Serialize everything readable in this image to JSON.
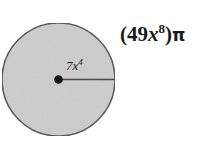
{
  "problem": {
    "number_fragment": "11."
  },
  "figure": {
    "shape": "circle",
    "fill_color": "#cfcfcf",
    "stroke_color": "#5a5a5a",
    "center_dot_color": "#141414",
    "radius_line_color": "#4a4a4a",
    "center": {
      "x": 58,
      "y": 79
    },
    "radius_px": 57,
    "radius_label": {
      "coefficient": "7",
      "variable": "x",
      "exponent": "4",
      "full": "7x⁴"
    }
  },
  "answer": {
    "open_paren": "(",
    "coefficient": "49",
    "variable": "x",
    "exponent": "8",
    "close_paren": ")",
    "pi": "π",
    "full": "(49x⁸)π"
  }
}
